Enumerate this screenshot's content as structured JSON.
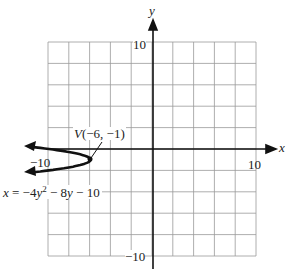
{
  "chart_data": {
    "type": "line",
    "title": "",
    "xlabel": "x",
    "ylabel": "y",
    "xlim": [
      -10,
      10
    ],
    "ylim": [
      -10,
      10
    ],
    "grid": true,
    "grid_step": 2,
    "x_tick_labels": [
      "-10",
      "10"
    ],
    "y_tick_labels": [
      "10",
      "-10"
    ],
    "series": [
      {
        "name": "x = -4y^2 - 8y - 10",
        "equation": "x = -4y² - 8y - 10",
        "points": [
          [
            -11,
            0.16
          ],
          [
            -10,
            0
          ],
          [
            -8,
            -0.29
          ],
          [
            -6,
            -1
          ],
          [
            -8,
            -1.71
          ],
          [
            -10,
            -2
          ],
          [
            -11,
            -2.16
          ]
        ]
      }
    ],
    "annotations": [
      {
        "text": "V(−6, −1)",
        "x": -6,
        "y": -1
      }
    ]
  },
  "labels": {
    "x_axis": "x",
    "y_axis": "y",
    "x_min": "−10",
    "x_max": "10",
    "y_max": "10",
    "y_min": "−10",
    "vertex": "V(−6, −1)",
    "equation_lhs": "x = −4y",
    "equation_exp": "2",
    "equation_rhs": " − 8y − 10"
  }
}
